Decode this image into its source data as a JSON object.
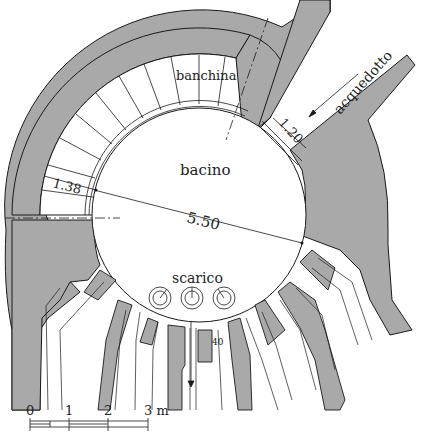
{
  "diagram": {
    "type": "architectural-plan",
    "colors": {
      "wall": "#a9a9a9",
      "line": "#1a1a1a",
      "background": "#ffffff"
    },
    "labels": {
      "banchina": "banchina",
      "bacino": "bacino",
      "acquedotto": "acquedotto",
      "scarico": "scarico"
    },
    "dimensions": {
      "diameter": "5.50",
      "banchina_width": "1.38",
      "aqueduct_width": "1.20",
      "drain_width": "40"
    },
    "scale_bar": {
      "ticks": [
        "0",
        "1",
        "2",
        "3 m"
      ]
    }
  }
}
